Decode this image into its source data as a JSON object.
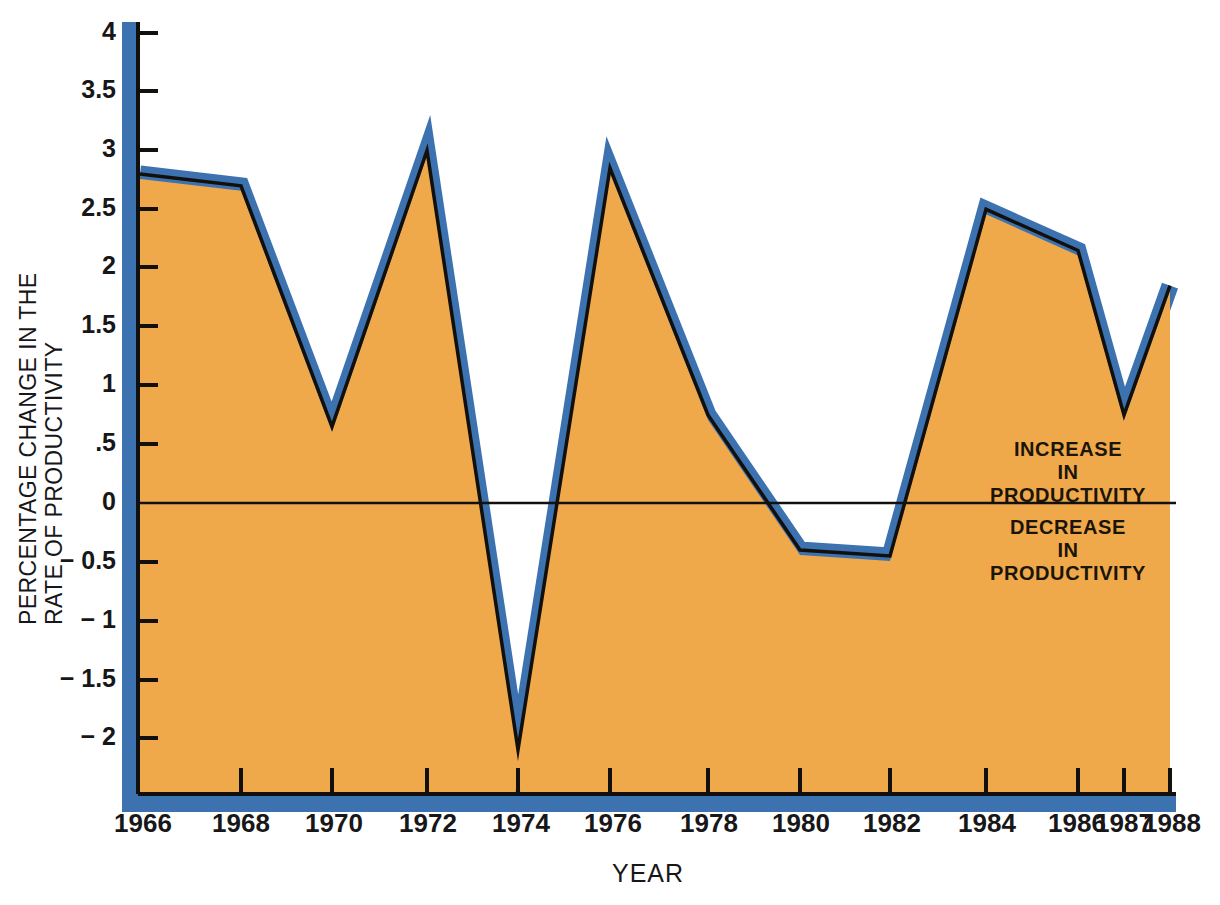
{
  "chart_data": {
    "type": "area",
    "title": "",
    "xlabel": "YEAR",
    "ylabel": "PERCENTAGE CHANGE IN THE RATE OF PRODUCTIVITY",
    "ylabel_lines": [
      "PERCENTAGE CHANGE IN THE",
      "RATE OF PRODUCTIVITY"
    ],
    "categories": [
      1966,
      1968,
      1970,
      1972,
      1974,
      1976,
      1978,
      1980,
      1982,
      1984,
      1986,
      1987,
      1988
    ],
    "x": [
      "1966",
      "1968",
      "1970",
      "1972",
      "1974",
      "1976",
      "1978",
      "1980",
      "1982",
      "1984",
      "1986",
      "1987",
      "1988"
    ],
    "values": [
      2.8,
      2.7,
      0.65,
      3.0,
      -2.1,
      2.85,
      0.75,
      -0.4,
      -0.45,
      2.5,
      2.15,
      0.75,
      1.85
    ],
    "series": [
      {
        "name": "Percentage change in the rate of productivity",
        "values": [
          2.8,
          2.7,
          0.65,
          3.0,
          -2.1,
          2.85,
          0.75,
          -0.4,
          -0.45,
          2.5,
          2.15,
          0.75,
          1.85
        ]
      }
    ],
    "yticks": [
      4,
      3.5,
      3,
      2.5,
      2,
      1.5,
      1,
      0.5,
      0,
      -0.5,
      -1,
      -1.5,
      -2
    ],
    "ytick_labels": [
      "4",
      "3.5",
      "3",
      "2.5",
      "2",
      "1.5",
      "1",
      ".5",
      "0",
      "− 0.5",
      "− 1",
      "− 1.5",
      "− 2"
    ],
    "ylim": [
      -2.4,
      4.0
    ],
    "xlim": [
      1966,
      1988
    ],
    "grid": false,
    "legend": "none",
    "zero_line": 0,
    "annotations": [
      {
        "id": "increase",
        "lines": [
          "INCREASE",
          "IN",
          "PRODUCTIVITY"
        ],
        "position": "above-zero-line-right"
      },
      {
        "id": "decrease",
        "lines": [
          "DECREASE",
          "IN",
          "PRODUCTIVITY"
        ],
        "position": "below-zero-line-right"
      }
    ],
    "colors": {
      "fill": "#EFA94A",
      "line": "#3D72B0",
      "outline": "#12100c",
      "axis": "#12100c",
      "background": "#ffffff",
      "text": "#17171a"
    }
  },
  "axis": {
    "y_title_line1": "PERCENTAGE CHANGE IN THE",
    "y_title_line2": "RATE OF PRODUCTIVITY",
    "x_title": "YEAR",
    "ytick_0": "4",
    "ytick_1": "3.5",
    "ytick_2": "3",
    "ytick_3": "2.5",
    "ytick_4": "2",
    "ytick_5": "1.5",
    "ytick_6": "1",
    "ytick_7": ".5",
    "ytick_8": "0",
    "ytick_9": "− 0.5",
    "ytick_10": "− 1",
    "ytick_11": "− 1.5",
    "ytick_12": "− 2",
    "xtick_0": "1966",
    "xtick_1": "1968",
    "xtick_2": "1970",
    "xtick_3": "1972",
    "xtick_4": "1974",
    "xtick_5": "1976",
    "xtick_6": "1978",
    "xtick_7": "1980",
    "xtick_8": "1982",
    "xtick_9": "1984",
    "xtick_10": "1986",
    "xtick_11": "1987",
    "xtick_12": "1988"
  },
  "annotations": {
    "increase_line1": "INCREASE",
    "increase_line2": "IN",
    "increase_line3": "PRODUCTIVITY",
    "decrease_line1": "DECREASE",
    "decrease_line2": "IN",
    "decrease_line3": "PRODUCTIVITY"
  }
}
